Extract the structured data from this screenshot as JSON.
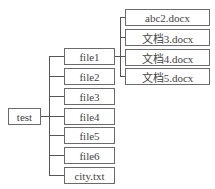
{
  "diagram": {
    "type": "tree",
    "root": {
      "label": "test"
    },
    "level1": [
      {
        "label": "file1"
      },
      {
        "label": "file2"
      },
      {
        "label": "file3"
      },
      {
        "label": "file4"
      },
      {
        "label": "file5"
      },
      {
        "label": "file6"
      },
      {
        "label": "city.txt"
      }
    ],
    "file1_children": [
      {
        "label": "abc2.docx"
      },
      {
        "label": "文档3.docx"
      },
      {
        "label": "文档4.docx"
      },
      {
        "label": "文档5.docx"
      }
    ],
    "colors": {
      "line": "#555555",
      "border": "#6a6a6a",
      "text": "#444444"
    }
  }
}
